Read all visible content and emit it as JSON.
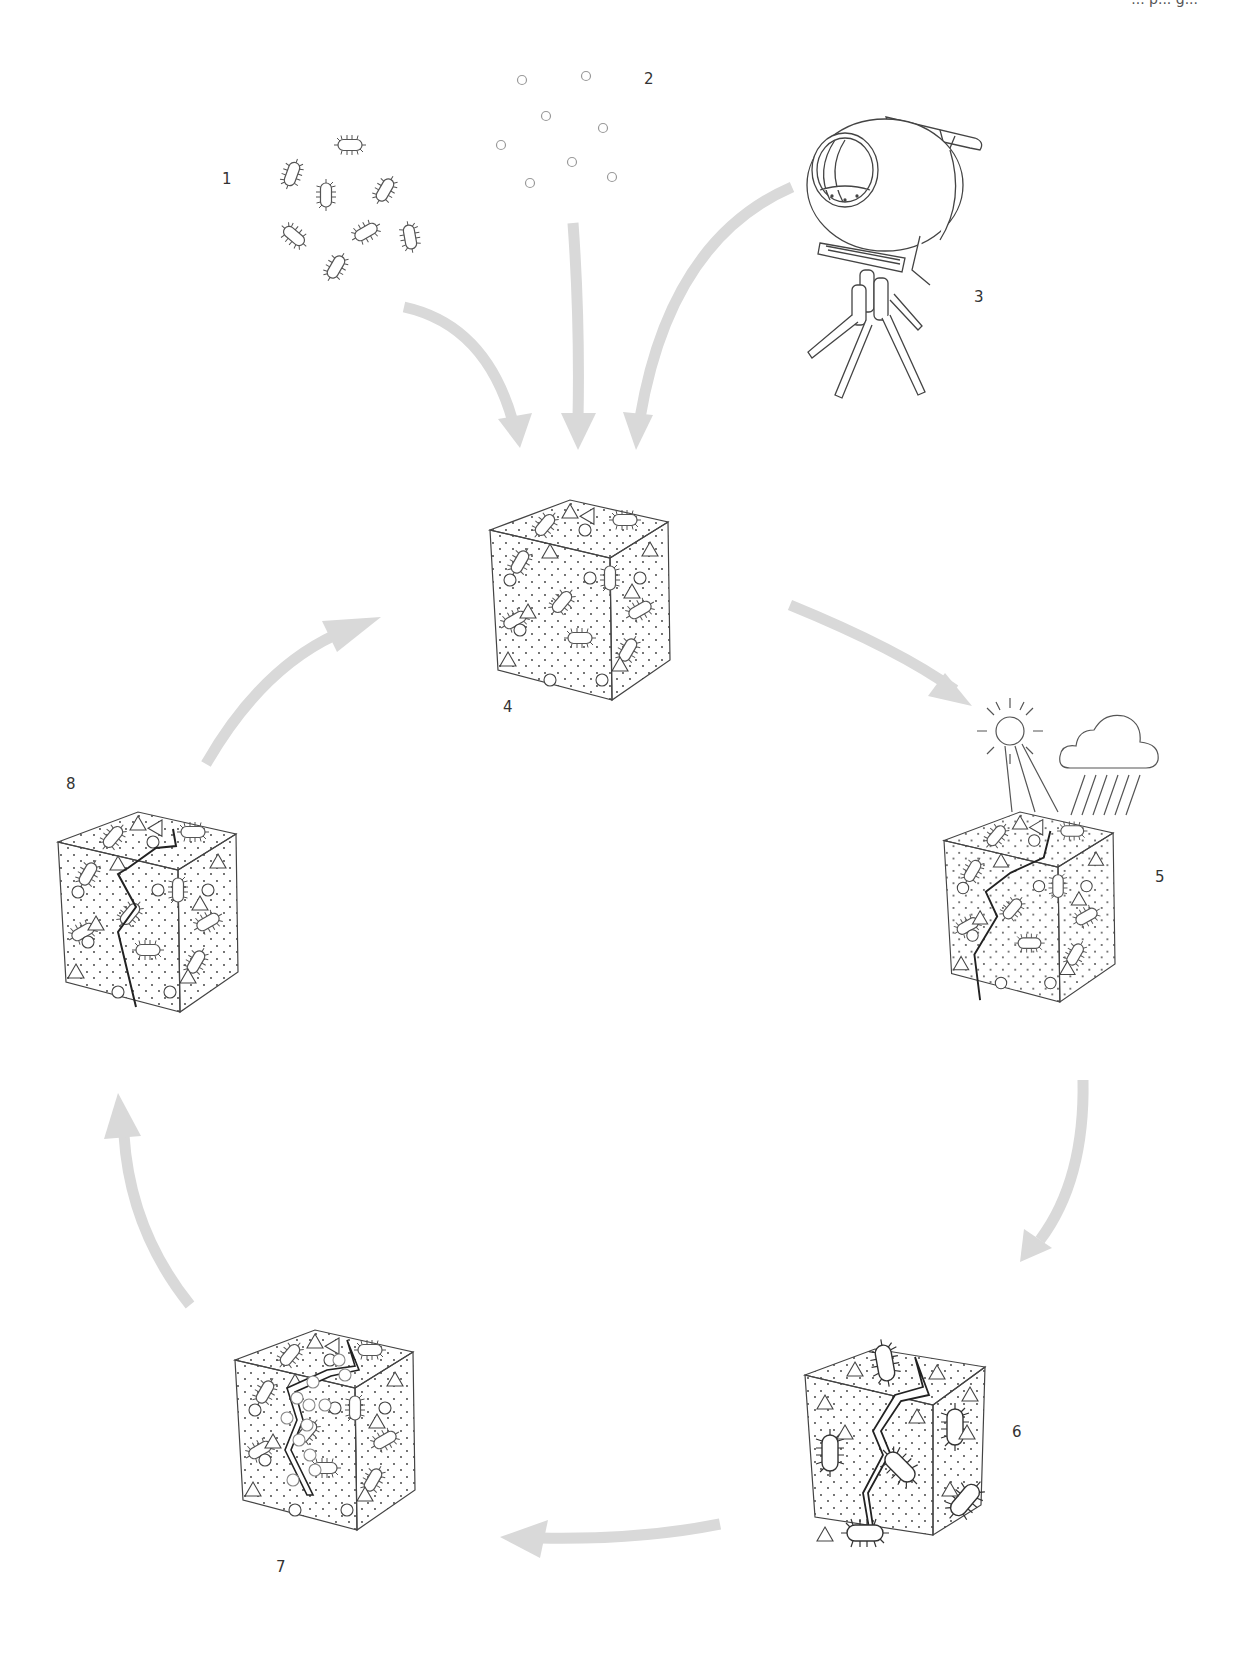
{
  "header": {
    "cut_text": "... p... g..."
  },
  "colors": {
    "arrow": "#d9d9d9",
    "line": "#444444",
    "crack": "#222222",
    "label": "#333333",
    "background": "#ffffff"
  },
  "steps": [
    {
      "id": 1,
      "label": "1",
      "subject": "bacteria",
      "icon": "bacteria-icon",
      "x": 222,
      "y": 172
    },
    {
      "id": 2,
      "label": "2",
      "subject": "nutrient particles",
      "icon": "particles-icon",
      "x": 644,
      "y": 72
    },
    {
      "id": 3,
      "label": "3",
      "subject": "concrete mixer",
      "icon": "concrete-mixer-icon",
      "x": 974,
      "y": 290
    },
    {
      "id": 4,
      "label": "4",
      "subject": "concrete block with bacteria",
      "icon": "concrete-cube-icon",
      "x": 503,
      "y": 690
    },
    {
      "id": 5,
      "label": "5",
      "subject": "weathering by sun and rain, crack forms",
      "icon": "cracked-cube-weather-icon",
      "x": 1155,
      "y": 870
    },
    {
      "id": 6,
      "label": "6",
      "subject": "bacteria activated in wide crack",
      "icon": "cracked-cube-icon",
      "x": 1012,
      "y": 1425
    },
    {
      "id": 7,
      "label": "7",
      "subject": "crack being filled",
      "icon": "healing-cube-icon",
      "x": 276,
      "y": 1560
    },
    {
      "id": 8,
      "label": "8",
      "subject": "healed crack",
      "icon": "healed-cube-icon",
      "x": 66,
      "y": 777
    }
  ],
  "arrows": [
    {
      "from": "1",
      "to": "4"
    },
    {
      "from": "2",
      "to": "4"
    },
    {
      "from": "3",
      "to": "4"
    },
    {
      "from": "4",
      "to": "5"
    },
    {
      "from": "5",
      "to": "6"
    },
    {
      "from": "6",
      "to": "7"
    },
    {
      "from": "7",
      "to": "8"
    },
    {
      "from": "8",
      "to": "4"
    }
  ]
}
